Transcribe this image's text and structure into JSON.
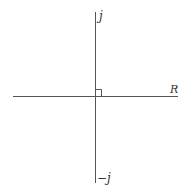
{
  "diagram": {
    "type": "complex-plane-axes",
    "labels": {
      "positive_imaginary": "j",
      "negative_imaginary": "−j",
      "real_axis": "R"
    },
    "right_angle_marker": true,
    "colors": {
      "axis": "#555555",
      "background": "#ffffff"
    }
  }
}
